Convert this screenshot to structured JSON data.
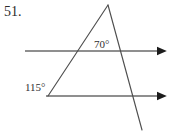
{
  "figure": {
    "problem_number": "51.",
    "canvas": {
      "width": 176,
      "height": 135
    },
    "background_color": "#ffffff",
    "line_color": "#5d5d5d",
    "text_color": "#262626",
    "angle_labels": [
      {
        "name": "apex-angle",
        "text": "70°",
        "value": 70,
        "unit": "degrees",
        "position": {
          "x": 94,
          "y": 39
        }
      },
      {
        "name": "lower-left-angle",
        "text": "115°",
        "value": 115,
        "unit": "degrees",
        "position": {
          "x": 25,
          "y": 82
        }
      }
    ],
    "parallel_lines": [
      {
        "name": "upper-parallel-line",
        "from": {
          "x": 25,
          "y": 51
        },
        "to": {
          "x": 166,
          "y": 51
        },
        "arrowhead": "right"
      },
      {
        "name": "lower-parallel-line",
        "from": {
          "x": 46,
          "y": 96
        },
        "to": {
          "x": 166,
          "y": 96
        },
        "arrowhead": "right"
      }
    ],
    "transversals": [
      {
        "name": "ascending-transversal",
        "from": {
          "x": 48,
          "y": 96
        },
        "to": {
          "x": 108,
          "y": 5
        },
        "arrowhead": "none"
      },
      {
        "name": "descending-transversal",
        "from": {
          "x": 108,
          "y": 5
        },
        "to": {
          "x": 142,
          "y": 130
        },
        "arrowhead": "none"
      }
    ],
    "vertices": {
      "apex": {
        "x": 108,
        "y": 5
      },
      "ascending_meets_upper": {
        "x": 76,
        "y": 51
      },
      "ascending_meets_lower": {
        "x": 48,
        "y": 96
      },
      "descending_meets_upper": {
        "x": 120,
        "y": 51
      },
      "descending_meets_lower": {
        "x": 131,
        "y": 96
      }
    }
  }
}
